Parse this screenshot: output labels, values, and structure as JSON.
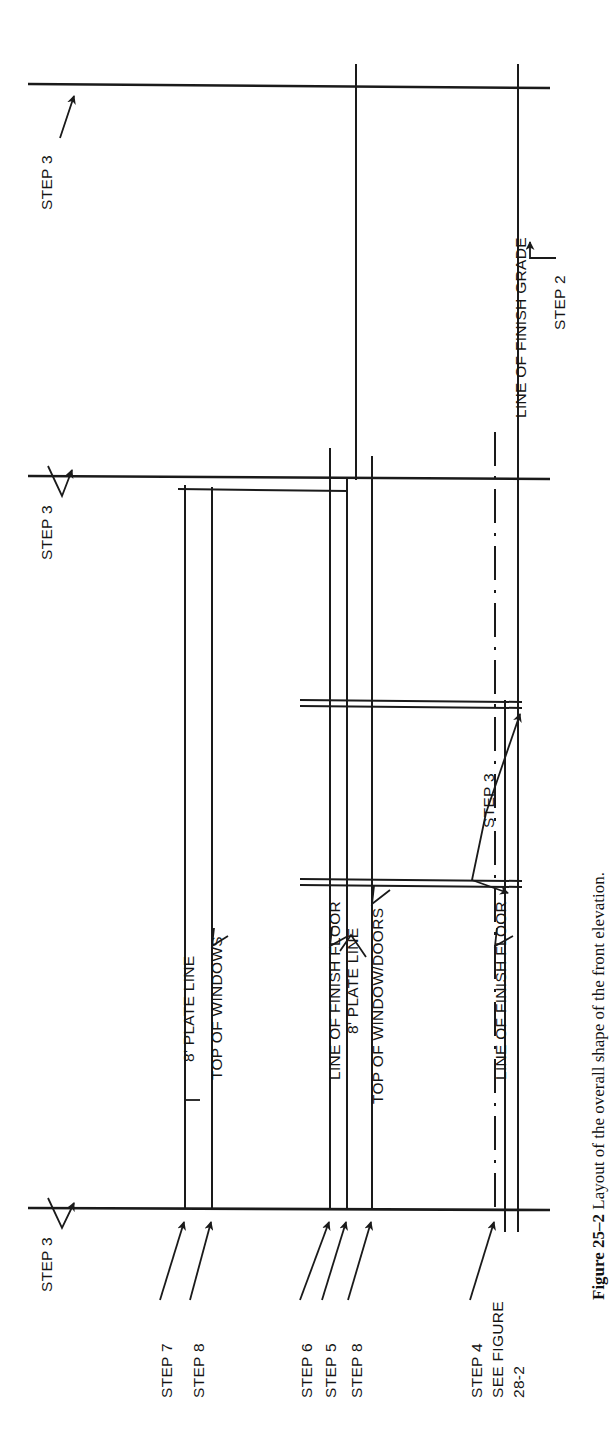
{
  "figure": {
    "number": "Figure 25–2",
    "caption_text": "Layout of the overall shape of the front elevation.",
    "full_caption": "Figure 25–2 Layout of the overall shape of the front elevation."
  },
  "orientation": {
    "rotation_degrees": -90,
    "note": "drawing and its labels are printed rotated 90° counter-clockwise on the page"
  },
  "colors": {
    "ink": "#1a1a1a",
    "paper": "#ffffff"
  },
  "drawing_labels": {
    "line_of_finish_grade": "LINE OF FINISH GRADE",
    "plate_line_upper": "8' PLATE LINE",
    "top_of_windows": "TOP OF WINDOWS",
    "line_of_finish_floor_upper": "LINE OF FINISH FLOOR",
    "plate_line_lower": "8' PLATE LINE",
    "top_of_window_doors": "TOP OF WINDOW/DOORS",
    "line_of_finish_floor_lower": "LINE OF FINISH FLOOR"
  },
  "step_callouts": {
    "step_3_top": "STEP 3",
    "step_3_middle": "STEP 3",
    "step_3_bottom_left": "STEP 3",
    "step_3_window": "STEP 3",
    "step_2": "STEP 2",
    "step_7": "STEP 7",
    "step_8_a": "STEP 8",
    "step_6": "STEP 6",
    "step_5": "STEP 5",
    "step_8_b": "STEP 8",
    "step_4": "STEP 4",
    "see_figure_line1": "SEE FIGURE",
    "see_figure_line2": "28-2"
  }
}
